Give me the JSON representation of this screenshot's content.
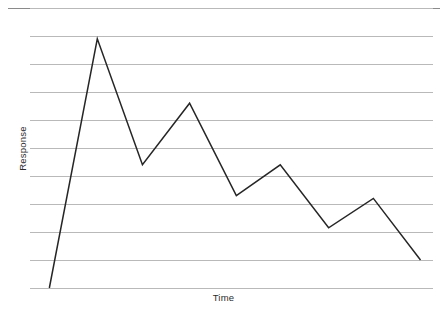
{
  "figure": {
    "page_rule_color": "#8a8a8a",
    "gridline_color": "#b9b9b9",
    "series_color": "#262626",
    "background": "#ffffff",
    "cut_off_top_text": ""
  },
  "chart_data": {
    "type": "line",
    "title": "",
    "subtitle": "",
    "xlabel": "Time",
    "ylabel": "Response",
    "grid": true,
    "grid_orientation": "horizontal",
    "gridline_count": 11,
    "legend": false,
    "legend_position": "none",
    "xlim": [
      0,
      10
    ],
    "ylim": [
      0,
      10
    ],
    "xticks": [],
    "yticks": [],
    "xtick_labels": [],
    "ytick_labels": [],
    "annotations": [],
    "series": [
      {
        "name": "Response",
        "color": "#262626",
        "line_width": 1.5,
        "markers": false,
        "x": [
          0.48,
          1.67,
          2.79,
          3.96,
          5.12,
          6.21,
          7.41,
          8.52,
          9.69
        ],
        "values": [
          0.0,
          8.9,
          4.4,
          6.6,
          3.3,
          4.4,
          2.15,
          3.2,
          1.0
        ]
      }
    ]
  }
}
